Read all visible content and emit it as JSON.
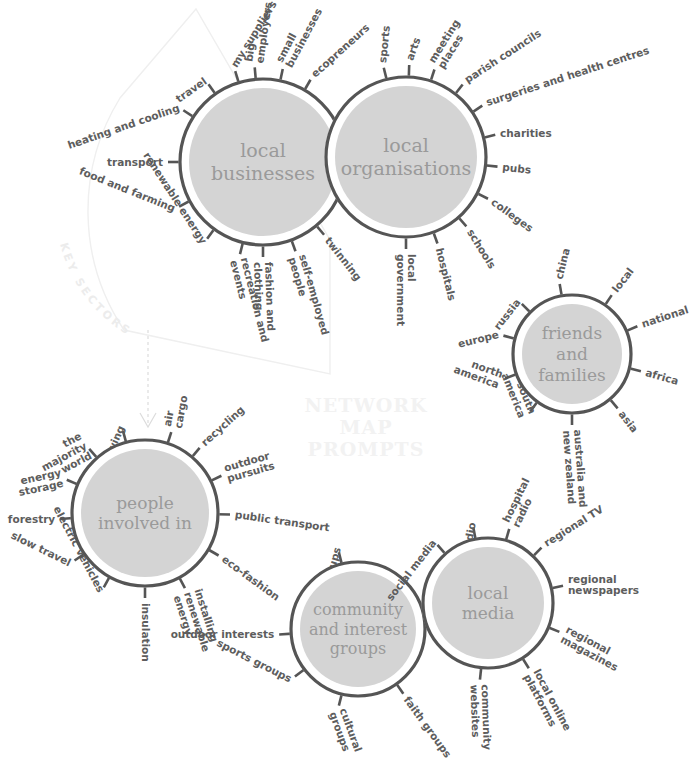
{
  "meta": {
    "watermark_lines": [
      "NETWORK",
      "MAP",
      "PROMPTS"
    ],
    "key_sectors_label": "KEY SECTORS",
    "colors": {
      "ring_stroke": "#555555",
      "inner_fill": "#d4d4d4",
      "gap": "#ffffff",
      "spoke_stroke": "#555555",
      "label_text": "#5d5d5d",
      "hub_text": "#9a9a9a",
      "watermark": "#f2f2f2",
      "faint_guide": "#efefef"
    }
  },
  "nodes": [
    {
      "id": "local-businesses",
      "title": "local\nbusinesses",
      "title_lines": [
        "local",
        "businesses"
      ],
      "cx": 263,
      "cy": 162,
      "r": 83,
      "title_size": 19,
      "spokes": [
        {
          "label": "travel",
          "angle": -125,
          "rot": -35,
          "anchor": "end"
        },
        {
          "label": "my suppliers",
          "angle": -107,
          "rot": -58,
          "anchor": "start"
        },
        {
          "label": "big\nemployers",
          "lines": [
            "big",
            "employers"
          ],
          "angle": -95,
          "rot": -82,
          "anchor": "start"
        },
        {
          "label": "small\nbusinesses",
          "lines": [
            "small",
            "businesses"
          ],
          "angle": -78,
          "rot": -62,
          "anchor": "start"
        },
        {
          "label": "ecopreneurs",
          "angle": -60,
          "rot": -42,
          "anchor": "start"
        },
        {
          "label": "heating and cooling",
          "angle": -147,
          "rot": -19,
          "anchor": "end"
        },
        {
          "label": "transport",
          "angle": -180,
          "rot": 0,
          "anchor": "end"
        },
        {
          "label": "food and farming",
          "angle": 152,
          "rot": 22,
          "anchor": "end"
        },
        {
          "label": "renewable energy",
          "angle": 126,
          "rot": 57,
          "anchor": "end"
        },
        {
          "label": "recreation and\nevents",
          "lines": [
            "recreation and",
            "events"
          ],
          "angle": 104,
          "rot": 76,
          "anchor": "start"
        },
        {
          "label": "fashion and\nclothing",
          "lines": [
            "fashion and",
            "clothing"
          ],
          "angle": 90,
          "rot": 88,
          "anchor": "start"
        },
        {
          "label": "self-employed\npeople",
          "lines": [
            "self-employed",
            "people"
          ],
          "angle": 70,
          "rot": 74,
          "anchor": "start"
        },
        {
          "label": "twinning",
          "angle": 50,
          "rot": 52,
          "anchor": "start"
        }
      ]
    },
    {
      "id": "local-organisations",
      "title": "local\norganisations",
      "title_lines": [
        "local",
        "organisations"
      ],
      "cx": 406,
      "cy": 157,
      "r": 80,
      "title_size": 19,
      "spokes": [
        {
          "label": "sports",
          "angle": -104,
          "rot": -84,
          "anchor": "start"
        },
        {
          "label": "arts",
          "angle": -88,
          "rot": -70,
          "anchor": "start"
        },
        {
          "label": "meeting\nplaces",
          "lines": [
            "meeting",
            "places"
          ],
          "angle": -72,
          "rot": -58,
          "anchor": "start"
        },
        {
          "label": "parish councils",
          "angle": -52,
          "rot": -33,
          "anchor": "start"
        },
        {
          "label": "surgeries and health centres",
          "angle": -34,
          "rot": -18,
          "anchor": "start"
        },
        {
          "label": "charities",
          "angle": -14,
          "rot": 0,
          "anchor": "start"
        },
        {
          "label": "pubs",
          "angle": 6,
          "rot": 6,
          "anchor": "start"
        },
        {
          "label": "colleges",
          "angle": 27,
          "rot": 36,
          "anchor": "start"
        },
        {
          "label": "schools",
          "angle": 49,
          "rot": 58,
          "anchor": "start"
        },
        {
          "label": "hospitals",
          "angle": 70,
          "rot": 76,
          "anchor": "start"
        },
        {
          "label": "local\ngovernment",
          "lines": [
            "local",
            "government"
          ],
          "angle": 90,
          "rot": 90,
          "anchor": "start"
        }
      ]
    },
    {
      "id": "friends-and-families",
      "title": "friends\nand\nfamilies",
      "title_lines": [
        "friends",
        "and",
        "families"
      ],
      "cx": 572,
      "cy": 354,
      "r": 59,
      "title_size": 17,
      "spokes": [
        {
          "label": "china",
          "angle": -100,
          "rot": -76,
          "anchor": "start"
        },
        {
          "label": "local",
          "angle": -56,
          "rot": -52,
          "anchor": "start"
        },
        {
          "label": "national",
          "angle": -23,
          "rot": -18,
          "anchor": "start"
        },
        {
          "label": "africa",
          "angle": 14,
          "rot": 16,
          "anchor": "start"
        },
        {
          "label": "asia",
          "angle": 50,
          "rot": 52,
          "anchor": "start"
        },
        {
          "label": "australia and\nnew zealand",
          "lines": [
            "australia and",
            "new zealand"
          ],
          "angle": 90,
          "rot": 86,
          "anchor": "start"
        },
        {
          "label": "south\namerica",
          "lines": [
            "south",
            "america"
          ],
          "angle": 126,
          "rot": 68,
          "anchor": "end"
        },
        {
          "label": "north\namerica",
          "lines": [
            "north",
            "america"
          ],
          "angle": 160,
          "rot": 20,
          "anchor": "end"
        },
        {
          "label": "europe",
          "angle": -165,
          "rot": -14,
          "anchor": "end"
        },
        {
          "label": "russia",
          "angle": -135,
          "rot": -52,
          "anchor": "end"
        }
      ]
    },
    {
      "id": "people-involved-in",
      "title": "people\ninvolved in",
      "title_lines": [
        "people",
        "involved in"
      ],
      "cx": 145,
      "cy": 513,
      "r": 73,
      "title_size": 17,
      "spokes": [
        {
          "label": "air\ncargo",
          "lines": [
            "air",
            "cargo"
          ],
          "angle": -72,
          "rot": -80,
          "anchor": "start"
        },
        {
          "label": "recycling",
          "angle": -50,
          "rot": -42,
          "anchor": "start"
        },
        {
          "label": "outdoor\npursuits",
          "lines": [
            "outdoor",
            "pursuits"
          ],
          "angle": -26,
          "rot": -16,
          "anchor": "start"
        },
        {
          "label": "public transport",
          "angle": 1,
          "rot": 8,
          "anchor": "start"
        },
        {
          "label": "eco-fashion",
          "angle": 30,
          "rot": 36,
          "anchor": "start"
        },
        {
          "label": "installing\nrenewable\nenergy",
          "lines": [
            "installing",
            "renewable",
            "energy"
          ],
          "angle": 62,
          "rot": 72,
          "anchor": "start"
        },
        {
          "label": "insulation",
          "angle": 90,
          "rot": 90,
          "anchor": "start"
        },
        {
          "label": "electric vehicles",
          "angle": 119,
          "rot": 62,
          "anchor": "end"
        },
        {
          "label": "slow travel",
          "angle": 146,
          "rot": 26,
          "anchor": "end"
        },
        {
          "label": "forestry",
          "angle": 176,
          "rot": 0,
          "anchor": "end"
        },
        {
          "label": "energy\nstorage",
          "lines": [
            "energy",
            "storage"
          ],
          "angle": -157,
          "rot": -12,
          "anchor": "end"
        },
        {
          "label": "the\nmajority\nworld",
          "lines": [
            "the",
            "majority",
            "world"
          ],
          "angle": -131,
          "rot": -28,
          "anchor": "end"
        },
        {
          "label": "vegetable growing",
          "angle": -105,
          "rot": -66,
          "anchor": "end"
        }
      ]
    },
    {
      "id": "community-and-interest-groups",
      "title": "community\nand interest\ngroups",
      "title_lines": [
        "community",
        "and interest",
        "groups"
      ],
      "cx": 358,
      "cy": 629,
      "r": 67,
      "title_size": 16,
      "spokes": [
        {
          "label": "hobby groups",
          "angle": -104,
          "rot": -74,
          "anchor": "end"
        },
        {
          "label": "outdoor interests",
          "angle": 176,
          "rot": 0,
          "anchor": "end"
        },
        {
          "label": "sports groups",
          "angle": 143,
          "rot": 27,
          "anchor": "end"
        },
        {
          "label": "cultural\ngroups",
          "lines": [
            "cultural",
            "groups"
          ],
          "angle": 104,
          "rot": 70,
          "anchor": "start"
        },
        {
          "label": "faith groups",
          "angle": 55,
          "rot": 54,
          "anchor": "start"
        }
      ]
    },
    {
      "id": "local-media",
      "title": "local\nmedia",
      "title_lines": [
        "local",
        "media"
      ],
      "cx": 488,
      "cy": 603,
      "r": 65,
      "title_size": 17,
      "spokes": [
        {
          "label": "social media",
          "angle": -131,
          "rot": -52,
          "anchor": "end"
        },
        {
          "label": "public radio",
          "angle": -101,
          "rot": -80,
          "anchor": "end"
        },
        {
          "label": "hospital\nradio",
          "lines": [
            "hospital",
            "radio"
          ],
          "angle": -74,
          "rot": -64,
          "anchor": "start"
        },
        {
          "label": "regional TV",
          "angle": -46,
          "rot": -32,
          "anchor": "start"
        },
        {
          "label": "regional\nnewspapers",
          "lines": [
            "regional",
            "newspapers"
          ],
          "angle": -13,
          "rot": 0,
          "anchor": "start"
        },
        {
          "label": "regional\nmagazines",
          "lines": [
            "regional",
            "magazines"
          ],
          "angle": 22,
          "rot": 28,
          "anchor": "start"
        },
        {
          "label": "local online\nplatforms",
          "lines": [
            "local online",
            "platforms"
          ],
          "angle": 58,
          "rot": 62,
          "anchor": "start"
        },
        {
          "label": "community\nwebsites",
          "lines": [
            "community",
            "websites"
          ],
          "angle": 96,
          "rot": 88,
          "anchor": "start"
        }
      ]
    }
  ]
}
